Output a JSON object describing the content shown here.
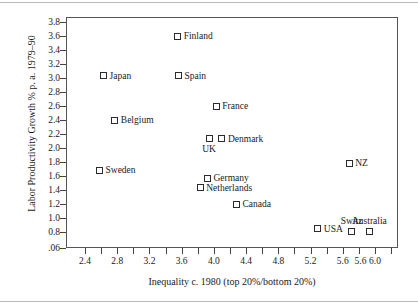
{
  "figure": {
    "background_color": "#ffffff",
    "frame_color": "#555555",
    "marker_color": "#2b2b2b",
    "text_color": "#1a1a1a"
  },
  "chart_data": {
    "type": "scatter",
    "title": "",
    "xlabel": "Inequality c. 1980 (top 20%/bottom 20%)",
    "ylabel": "Labor Productivity Growth % p. a. 1979–90",
    "xlim": [
      2.27,
      6.23
    ],
    "ylim": [
      0.06,
      3.87
    ],
    "grid": false,
    "legend": "none",
    "x_tick_labels": [
      "2.4",
      "2.8",
      "3.2",
      "3.6",
      "4.0",
      "4.4",
      "4.8",
      "5.2",
      "5.6",
      "5.6",
      "6.0"
    ],
    "x_tick_values": [
      2.4,
      2.8,
      3.2,
      3.6,
      4.0,
      4.4,
      4.8,
      5.2,
      5.6,
      5.6,
      6.0
    ],
    "x_minor_ticks": [
      2.4,
      2.6,
      2.8,
      3.0,
      3.2,
      3.4,
      3.6,
      3.8,
      4.0,
      4.2,
      4.4,
      4.6,
      4.8,
      5.0,
      5.2,
      5.4,
      5.6,
      5.8,
      6.0,
      6.2
    ],
    "y_tick_labels": [
      "3.8",
      "3.6",
      "3.4",
      "3.2",
      "3.0",
      "2.8",
      "2.6",
      "2.4",
      "2.2",
      "2.0",
      "1.8",
      "1.6",
      "1.4",
      "1.2",
      "1.0",
      "0.8",
      ".06"
    ],
    "y_tick_values": [
      3.8,
      3.6,
      3.4,
      3.2,
      3.0,
      2.8,
      2.6,
      2.4,
      2.2,
      2.0,
      1.8,
      1.6,
      1.4,
      1.2,
      1.0,
      0.8,
      0.06
    ],
    "points": [
      {
        "label": "Finland",
        "x": 3.55,
        "y": 3.6,
        "label_pos": "right"
      },
      {
        "label": "Japan",
        "x": 2.63,
        "y": 3.03,
        "label_pos": "right"
      },
      {
        "label": "Spain",
        "x": 3.56,
        "y": 3.03,
        "label_pos": "right"
      },
      {
        "label": "France",
        "x": 4.03,
        "y": 2.6,
        "label_pos": "right"
      },
      {
        "label": "Belgium",
        "x": 2.77,
        "y": 2.4,
        "label_pos": "right"
      },
      {
        "label": "UK",
        "x": 3.94,
        "y": 2.13,
        "label_pos": "below"
      },
      {
        "label": "Denmark",
        "x": 4.1,
        "y": 2.13,
        "label_pos": "right"
      },
      {
        "label": "NZ",
        "x": 5.68,
        "y": 1.78,
        "label_pos": "right"
      },
      {
        "label": "Sweden",
        "x": 2.58,
        "y": 1.68,
        "label_pos": "right"
      },
      {
        "label": "Germany",
        "x": 3.92,
        "y": 1.57,
        "label_pos": "right"
      },
      {
        "label": "Netherlands",
        "x": 3.83,
        "y": 1.43,
        "label_pos": "right"
      },
      {
        "label": "Canada",
        "x": 4.28,
        "y": 1.2,
        "label_pos": "right"
      },
      {
        "label": "USA",
        "x": 5.29,
        "y": 0.85,
        "label_pos": "right"
      },
      {
        "label": "Switz",
        "x": 5.71,
        "y": 0.81,
        "label_pos": "above"
      },
      {
        "label": "Australia",
        "x": 5.93,
        "y": 0.81,
        "label_pos": "above"
      }
    ]
  }
}
